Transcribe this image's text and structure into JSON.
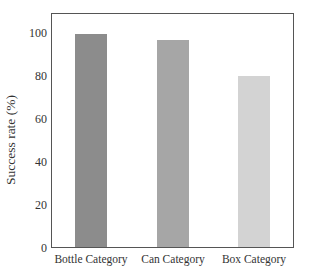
{
  "chart_data": {
    "type": "bar",
    "title": "",
    "categories": [
      "Bottle Category",
      "Can Category",
      "Box Category"
    ],
    "values": [
      99,
      96.5,
      79.5
    ],
    "colors": [
      "#8c8c8c",
      "#a6a6a6",
      "#d3d3d3"
    ],
    "xlabel": "",
    "ylabel": "Success rate (%)",
    "ylim": [
      0,
      110
    ],
    "yticks": [
      0,
      20,
      40,
      60,
      80,
      100
    ],
    "grid": false,
    "legend": null
  },
  "axis": {
    "ylabel": "Success rate (%)",
    "yticks": [
      "0",
      "20",
      "40",
      "60",
      "80",
      "100"
    ],
    "xticks": [
      "Bottle Category",
      "Can Category",
      "Box Category"
    ]
  }
}
